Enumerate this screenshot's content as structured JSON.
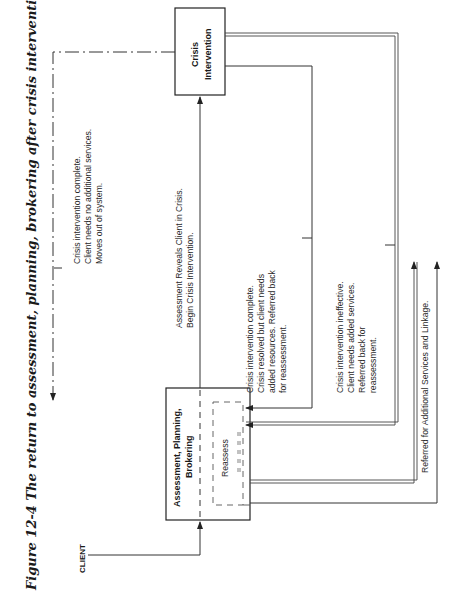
{
  "figure": {
    "title": "Figure 12-4  The return to assessment, planning, brokering after crisis intervention.",
    "client_label": "CLIENT",
    "boxes": {
      "assessment": {
        "line1": "Assessment, Planning,",
        "line2": "Brokering"
      },
      "crisis": {
        "line1": "Crisis",
        "line2": "Intervention"
      },
      "reassess": "Reassess"
    },
    "annotations": {
      "exit": [
        "Crisis intervention complete.",
        "Client needs no additional services.",
        "Moves out of system."
      ],
      "to_crisis": [
        "Assessment Reveals Client in Crisis.",
        "Begin Crisis Intervention."
      ],
      "resolved": [
        "Crisis intervention complete.",
        "Crisis resolved but client needs",
        "added resources. Referred back",
        "for reassessment."
      ],
      "ineffective": [
        "Crisis intervention ineffective.",
        "Client needs added services.",
        "Referred back for",
        "reassessment."
      ],
      "referral": "Referred for Additional Services and Linkage."
    },
    "orientation": "rotated 90 degrees counter-clockwise"
  }
}
